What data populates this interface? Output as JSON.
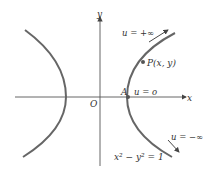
{
  "diagram": {
    "axis_x_label": "x",
    "axis_y_label": "y",
    "origin_label": "O",
    "vertex_label": "A",
    "point_label": "P(x, y)",
    "label_u_plus_inf": "u = +∞",
    "label_u_zero": "u = o",
    "label_u_minus_inf": "u = −∞",
    "equation": "x² − y² = 1",
    "colors": {
      "curve": "#666666",
      "axis": "#555555",
      "text": "#333333"
    }
  }
}
